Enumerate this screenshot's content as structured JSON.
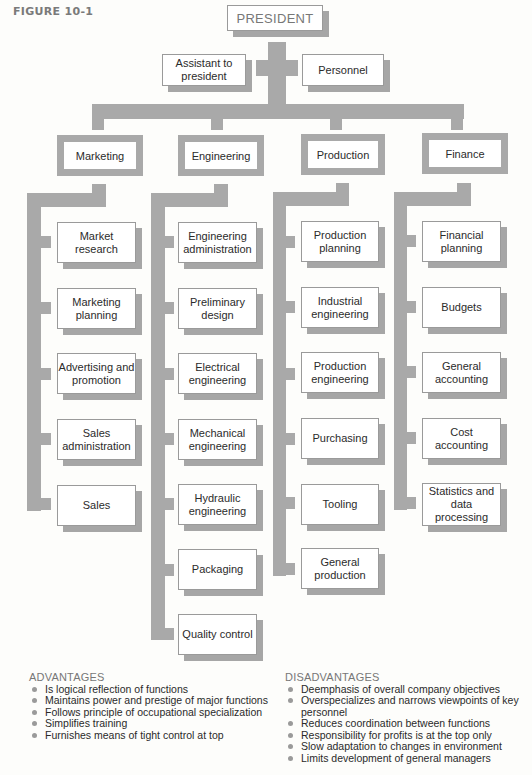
{
  "figure_label": "FIGURE 10-1",
  "top": {
    "president": "PRESIDENT",
    "staff_left": "Assistant to president",
    "staff_right": "Personnel"
  },
  "departments": [
    {
      "name": "Marketing",
      "units": [
        "Market research",
        "Marketing planning",
        "Advertising and promotion",
        "Sales administration",
        "Sales"
      ]
    },
    {
      "name": "Engineering",
      "units": [
        "Engineering administration",
        "Preliminary design",
        "Electrical engineering",
        "Mechanical engineering",
        "Hydraulic engineering",
        "Packaging",
        "Quality control"
      ]
    },
    {
      "name": "Production",
      "units": [
        "Production planning",
        "Industrial engineering",
        "Production engineering",
        "Purchasing",
        "Tooling",
        "General production"
      ]
    },
    {
      "name": "Finance",
      "units": [
        "Financial planning",
        "Budgets",
        "General accounting",
        "Cost accounting",
        "Statistics and data processing"
      ]
    }
  ],
  "advantages": {
    "title": "ADVANTAGES",
    "items": [
      "Is logical reflection of functions",
      "Maintains power and prestige of major functions",
      "Follows principle of occupational specialization",
      "Simplifies training",
      "Furnishes means of tight control at top"
    ]
  },
  "disadvantages": {
    "title": "DISADVANTAGES",
    "items": [
      "Deemphasis of overall company objectives",
      "Overspecializes and narrows viewpoints of key personnel",
      "Reduces coordination between functions",
      "Responsibility for profits is at the top only",
      "Slow adaptation to changes in environment",
      "Limits development of general managers"
    ]
  },
  "colors": {
    "connector": "#a9a9a9",
    "box_border": "#9a9a9a",
    "box_fill": "#ffffff",
    "text": "#2a2a2a",
    "heading": "#777777"
  }
}
